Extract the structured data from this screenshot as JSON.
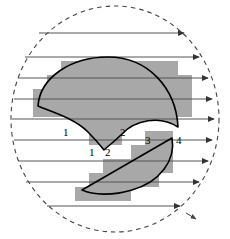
{
  "figure": {
    "colors": {
      "stroke": "#000000",
      "fill_gray": "#a8a8a8",
      "flow_line": "#555555",
      "boundary_dash": "#444444",
      "background": "#ffffff"
    },
    "boundary": {
      "name": "dashed-circle",
      "shape": "circle",
      "cx": 115,
      "cy": 119,
      "rx": 104,
      "ry": 113,
      "style": "dashed"
    },
    "flow_lines": {
      "name": "horizontal-arrow-lines",
      "count": 9,
      "direction": "left-to-right",
      "arrowheads": true,
      "y_values": [
        33,
        57,
        78,
        99,
        119,
        140,
        161,
        182,
        206
      ]
    },
    "dome_region": {
      "name": "scalloped-dome",
      "description": "Upper filled region: convex arc on top, two concave scallops below meeting at a central cusp",
      "filled": true,
      "top_arc_apex": {
        "x": 108,
        "y": 57
      },
      "left_corner": {
        "x": 38,
        "y": 106
      },
      "right_corner": {
        "x": 178,
        "y": 127
      },
      "cusp": {
        "x": 104,
        "y": 150
      }
    },
    "lens_region": {
      "name": "lens-crescent",
      "description": "Lower filled region bounded above by a straight chord and below by a circular arc",
      "filled": true,
      "left_point": {
        "x": 82,
        "y": 190
      },
      "right_point": {
        "x": 172,
        "y": 138
      }
    },
    "labels": [
      {
        "name": "label-1-upper",
        "text": "1",
        "x": 63,
        "y": 133
      },
      {
        "name": "label-2-upper",
        "text": "2",
        "x": 120,
        "y": 133
      },
      {
        "name": "label-1-lower",
        "text": "1",
        "x": 89,
        "y": 152
      },
      {
        "name": "label-2-lower",
        "text": "2",
        "x": 105,
        "y": 152
      },
      {
        "name": "label-3",
        "text": "3",
        "x": 145,
        "y": 140
      },
      {
        "name": "label-4",
        "text": "4",
        "x": 176,
        "y": 140
      }
    ],
    "raster_blocks": {
      "name": "pixelated-fill-blocks",
      "description": "Gray staircase blocks approximating the filled regions on a coarse pixel grid",
      "cell_w": 14,
      "cell_h": 14,
      "dome_cells": [
        [
          61,
          61,
          117,
          14
        ],
        [
          47,
          75,
          145,
          14
        ],
        [
          33,
          89,
          159,
          14
        ],
        [
          33,
          103,
          33,
          14
        ],
        [
          75,
          103,
          61,
          14
        ],
        [
          159,
          103,
          33,
          14
        ],
        [
          89,
          117,
          33,
          14
        ],
        [
          89,
          131,
          33,
          14
        ]
      ],
      "lens_cells": [
        [
          145,
          131,
          28,
          14
        ],
        [
          131,
          145,
          42,
          14
        ],
        [
          103,
          159,
          70,
          14
        ],
        [
          89,
          173,
          70,
          14
        ],
        [
          75,
          187,
          56,
          14
        ]
      ]
    }
  }
}
